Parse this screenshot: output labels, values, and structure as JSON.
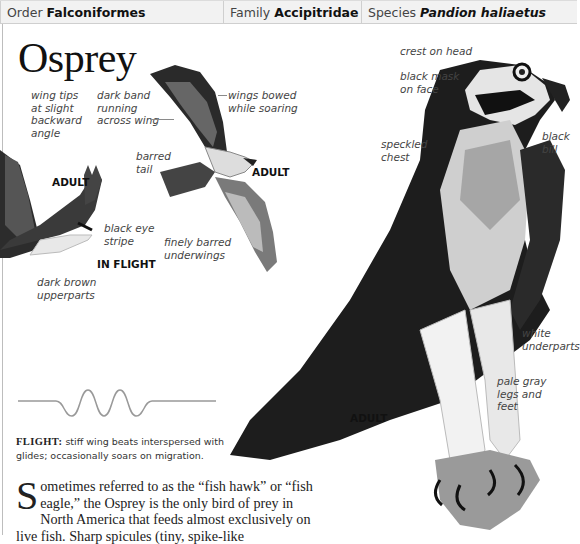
{
  "header": {
    "order_label": "Order",
    "order_value": "Falconiformes",
    "family_label": "Family",
    "family_value": "Accipitridae",
    "species_label": "Species",
    "species_value": "Pandion haliaetus"
  },
  "title": "Osprey",
  "illustrations": {
    "flying_left": {
      "tag_adult": "ADULT",
      "tag_in_flight": "IN FLIGHT",
      "labels": {
        "wing_tips": "wing tips\nat slight\nbackward\nangle",
        "black_eye_stripe": "black eye\nstripe",
        "dark_brown_upperparts": "dark brown\nupperparts"
      }
    },
    "soaring": {
      "tag_adult": "ADULT",
      "labels": {
        "dark_band": "dark band\nrunning\nacross wing",
        "wings_bowed": "wings bowed\nwhile soaring",
        "barred_tail": "barred\ntail",
        "finely_barred_underwings": "finely barred\nunderwings"
      }
    },
    "perched": {
      "tag_adult": "ADULT",
      "labels": {
        "crest_on_head": "crest on head",
        "black_mask": "black mask\non face",
        "black_bill": "black\nbill",
        "speckled_chest": "speckled\nchest",
        "white_underparts": "white\nunderparts",
        "pale_gray_legs": "pale gray\nlegs and\nfeet"
      }
    }
  },
  "flight": {
    "label": "FLIGHT:",
    "description": "stiff wing beats interspersed with glides; occasionally soars on migration."
  },
  "body": {
    "dropcap": "S",
    "text": "ometimes referred to as the “fish hawk” or “fish eagle,” the Osprey is the only bird of prey in North America that feeds almost exclusively on live fish. Sharp spicules (tiny, spike-like"
  },
  "colors": {
    "header_bg": "#f2f2f2",
    "rule": "#bdbdbd",
    "label_text": "#444444"
  }
}
